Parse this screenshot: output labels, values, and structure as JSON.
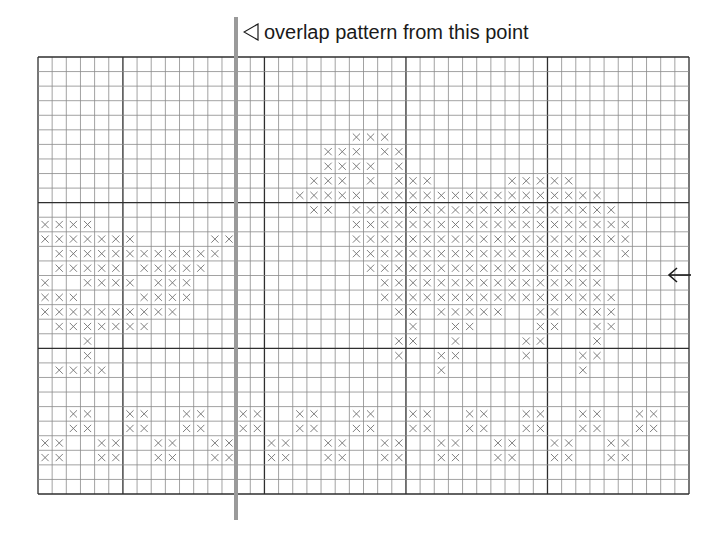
{
  "caption": {
    "marker_icon": "left-triangle-outline-icon",
    "text": "overlap pattern from this point"
  },
  "grid": {
    "columns": 46,
    "rows": 30,
    "bold_line_every": 10,
    "bold_column_offset": 6,
    "bold_row_offset": 0,
    "line_color": "#8a8a8a",
    "bold_line_color": "#2e2e2e",
    "mark_color": "#707070",
    "mark_symbol": "cross-stitch-x"
  },
  "overlap_marker": {
    "label": "overlap-start-line",
    "at_column": 14,
    "color": "#9a9a9a"
  },
  "row_arrow": {
    "icon": "left-arrow-icon",
    "at_row_line": 15
  },
  "stitches": {
    "5": [
      22,
      23,
      24
    ],
    "6": [
      20,
      21,
      22,
      24,
      25
    ],
    "7": [
      20,
      21,
      22,
      23,
      25
    ],
    "8": [
      19,
      20,
      21,
      23,
      25,
      26,
      27,
      33,
      34,
      35,
      36,
      37
    ],
    "9": [
      18,
      19,
      20,
      21,
      22,
      24,
      25,
      26,
      27,
      28,
      29,
      30,
      31,
      32,
      33,
      34,
      35,
      36,
      37,
      38,
      39
    ],
    "10": [
      19,
      20,
      22,
      23,
      24,
      25,
      26,
      27,
      28,
      29,
      30,
      31,
      32,
      33,
      34,
      35,
      36,
      37,
      38,
      39,
      40
    ],
    "11": [
      0,
      1,
      2,
      3,
      22,
      23,
      24,
      25,
      26,
      27,
      28,
      29,
      30,
      31,
      32,
      33,
      34,
      35,
      36,
      37,
      38,
      39,
      40,
      41
    ],
    "12": [
      0,
      1,
      2,
      3,
      4,
      5,
      6,
      12,
      13,
      22,
      23,
      24,
      25,
      26,
      27,
      28,
      29,
      30,
      31,
      32,
      33,
      34,
      35,
      36,
      37,
      38,
      39,
      40,
      41
    ],
    "13": [
      1,
      2,
      3,
      4,
      5,
      6,
      7,
      8,
      9,
      10,
      11,
      12,
      22,
      23,
      24,
      25,
      26,
      27,
      28,
      29,
      30,
      31,
      32,
      33,
      34,
      35,
      36,
      37,
      38,
      39,
      41
    ],
    "14": [
      1,
      2,
      3,
      4,
      5,
      7,
      8,
      9,
      10,
      11,
      23,
      24,
      25,
      26,
      27,
      28,
      29,
      30,
      31,
      32,
      33,
      34,
      35,
      36,
      37,
      38,
      39
    ],
    "15": [
      0,
      3,
      4,
      5,
      6,
      8,
      9,
      10,
      24,
      25,
      26,
      27,
      28,
      29,
      30,
      31,
      32,
      33,
      34,
      35,
      36,
      37,
      38,
      39
    ],
    "16": [
      0,
      1,
      2,
      7,
      8,
      9,
      10,
      24,
      25,
      26,
      27,
      28,
      29,
      30,
      31,
      32,
      33,
      34,
      35,
      36,
      37,
      38,
      39,
      40
    ],
    "17": [
      0,
      1,
      2,
      3,
      4,
      5,
      6,
      7,
      8,
      9,
      25,
      26,
      28,
      29,
      30,
      31,
      32,
      35,
      36,
      38,
      39,
      40
    ],
    "18": [
      1,
      2,
      3,
      4,
      5,
      6,
      7,
      26,
      29,
      30,
      35,
      36,
      39,
      40
    ],
    "19": [
      3,
      25,
      26,
      29,
      34,
      35,
      39
    ],
    "20": [
      3,
      25,
      28,
      29,
      34,
      38,
      39
    ],
    "21": [
      1,
      2,
      3,
      4,
      28,
      38
    ],
    "24": [
      2,
      3,
      6,
      7,
      10,
      11,
      14,
      15,
      18,
      19,
      22,
      23,
      26,
      27,
      30,
      31,
      34,
      35,
      38,
      39,
      42,
      43
    ],
    "25": [
      2,
      3,
      6,
      7,
      10,
      11,
      14,
      15,
      18,
      19,
      22,
      23,
      26,
      27,
      30,
      31,
      34,
      35,
      38,
      39,
      42,
      43
    ],
    "26": [
      0,
      1,
      4,
      5,
      8,
      9,
      12,
      13,
      16,
      17,
      20,
      21,
      24,
      25,
      28,
      29,
      32,
      33,
      36,
      37,
      40,
      41
    ],
    "27": [
      0,
      1,
      4,
      5,
      8,
      9,
      12,
      13,
      16,
      17,
      20,
      21,
      24,
      25,
      28,
      29,
      32,
      33,
      36,
      37,
      40,
      41
    ]
  }
}
